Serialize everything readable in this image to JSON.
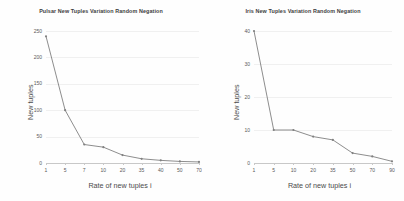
{
  "chart_data": [
    {
      "type": "line",
      "title": "Pulsar New Tuples Variation Random Negation",
      "xlabel": "Rate of new tuples i",
      "ylabel": "New tuples",
      "categories": [
        "1",
        "5",
        "7",
        "10",
        "20",
        "35",
        "40",
        "50",
        "70"
      ],
      "values": [
        240,
        100,
        35,
        30,
        15,
        8,
        5,
        3,
        2
      ],
      "yticks": [
        "0",
        "50",
        "100",
        "150",
        "200",
        "250"
      ],
      "ytick_values": [
        0,
        50,
        100,
        150,
        200,
        250
      ],
      "ylim": [
        0,
        250
      ],
      "grid": true,
      "legend": "none",
      "series_color": "#808080"
    },
    {
      "type": "line",
      "title": "Iris New Tuples Variation Random Negation",
      "xlabel": "Rate of new tuples i",
      "ylabel": "New tuples",
      "categories": [
        "1",
        "5",
        "10",
        "20",
        "35",
        "50",
        "70",
        "90"
      ],
      "values": [
        40,
        10,
        10,
        8,
        7,
        3,
        2,
        0.5
      ],
      "yticks": [
        "0",
        "10",
        "20",
        "30",
        "40"
      ],
      "ytick_values": [
        0,
        10,
        20,
        30,
        40
      ],
      "ylim": [
        0,
        40
      ],
      "grid": true,
      "legend": "none",
      "series_color": "#808080"
    }
  ]
}
